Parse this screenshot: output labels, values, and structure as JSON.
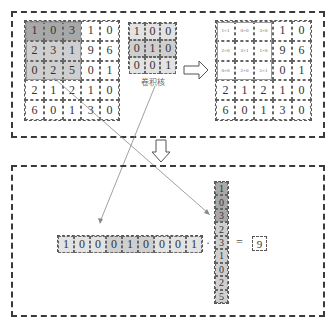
{
  "input_matrix": {
    "rows": [
      [
        "1",
        "0",
        "3",
        "1",
        "0"
      ],
      [
        "2",
        "3",
        "1",
        "9",
        "6"
      ],
      [
        "0",
        "2",
        "5",
        "0",
        "1"
      ],
      [
        "2",
        "1",
        "2",
        "1",
        "0"
      ],
      [
        "6",
        "0",
        "1",
        "3",
        "0"
      ]
    ]
  },
  "kernel": {
    "rows": [
      [
        "1",
        "0",
        "0"
      ],
      [
        "0",
        "1",
        "0"
      ],
      [
        "0",
        "0",
        "1"
      ]
    ],
    "label": "卷积核"
  },
  "product_matrix": {
    "rows": [
      [
        "1×1",
        "0×0",
        "3×0",
        "1",
        "0"
      ],
      [
        "2×0",
        "3×1",
        "1×0",
        "9",
        "6"
      ],
      [
        "0×0",
        "2×0",
        "5×1",
        "0",
        "1"
      ],
      [
        "2",
        "1",
        "2",
        "1",
        "0"
      ],
      [
        "6",
        "0",
        "1",
        "3",
        "0"
      ]
    ]
  },
  "row_vector": [
    "1",
    "0",
    "0",
    "0",
    "1",
    "0",
    "0",
    "0",
    "1"
  ],
  "column_vector": [
    "1",
    "0",
    "3",
    "2",
    "3",
    "1",
    "0",
    "2",
    "5"
  ],
  "operators": {
    "dot": "·",
    "equals": "="
  },
  "result": "9",
  "colors": {
    "dark": "#a8a8a8",
    "mid": "#cfcfcf",
    "light": "#e3e3e3",
    "border": "#3a3a3a"
  }
}
